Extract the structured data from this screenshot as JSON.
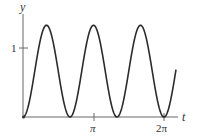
{
  "chart_data": {
    "type": "line",
    "title": "",
    "xlabel": "t",
    "ylabel": "y",
    "xlim": [
      0,
      2.17
    ],
    "xlim_units": "multiples of pi",
    "ylim": [
      0,
      1.4
    ],
    "grid": false,
    "legend": null,
    "x_ticks": [
      {
        "value": 1,
        "label": "π"
      },
      {
        "value": 2,
        "label": "2π"
      }
    ],
    "y_ticks": [
      {
        "value": 1,
        "label": "1"
      }
    ],
    "series": [
      {
        "name": "y(t)",
        "description": "Periodic curve, zeros at t = 0, 2π/3, 4π/3, 2π; peaks ≈ 1.33 at t = π/3, π, 5π/3",
        "x_over_pi": [
          0,
          0.1667,
          0.3333,
          0.5,
          0.6667,
          0.8333,
          1.0,
          1.1667,
          1.3333,
          1.5,
          1.6667,
          1.8333,
          2.0,
          2.17
        ],
        "y": [
          0,
          0.67,
          1.33,
          0.67,
          0,
          0.67,
          1.33,
          0.67,
          0,
          0.67,
          1.33,
          0.67,
          0,
          0.68
        ],
        "color": "#333333"
      }
    ]
  },
  "labels": {
    "y_axis": "y",
    "x_axis": "t",
    "y_tick_1": "1",
    "x_tick_pi": "π",
    "x_tick_2pi": "2π"
  },
  "colors": {
    "curve": "#2b2b2b",
    "axis": "#555555",
    "background": "#ffffff"
  }
}
